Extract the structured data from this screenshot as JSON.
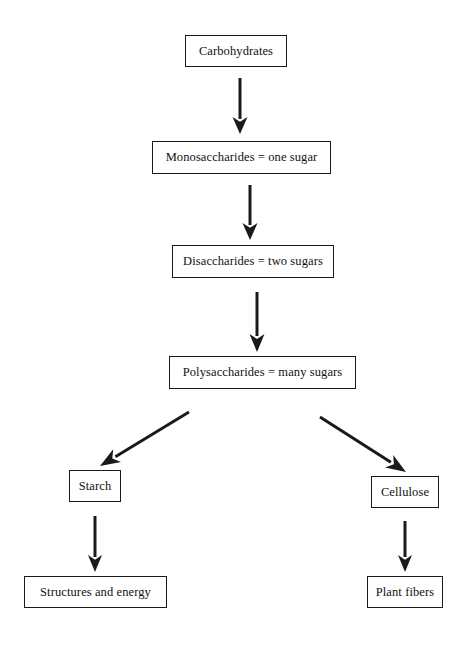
{
  "diagram": {
    "background_color": "#ffffff",
    "line_color": "#1a1a1a",
    "text_color": "#111111",
    "nodes": [
      {
        "id": "carbohydrates",
        "label": "Carbohydrates",
        "x": 185,
        "y": 35,
        "width": 102,
        "height": 32,
        "font_size": 12.5
      },
      {
        "id": "monosaccharides",
        "label": "Monosaccharides = one sugar",
        "x": 152,
        "y": 141,
        "width": 179,
        "height": 33,
        "font_size": 12.5
      },
      {
        "id": "disaccharides",
        "label": "Disaccharides = two sugars",
        "x": 172,
        "y": 245,
        "width": 162,
        "height": 33,
        "font_size": 12.5
      },
      {
        "id": "polysaccharides",
        "label": "Polysaccharides = many sugars",
        "x": 169,
        "y": 356,
        "width": 187,
        "height": 33,
        "font_size": 12.5
      },
      {
        "id": "starch",
        "label": "Starch",
        "x": 69,
        "y": 470,
        "width": 52,
        "height": 32,
        "font_size": 12.5
      },
      {
        "id": "cellulose",
        "label": "Cellulose",
        "x": 371,
        "y": 476,
        "width": 68,
        "height": 32,
        "font_size": 12.5
      },
      {
        "id": "structures-and-energy",
        "label": "Structures and energy",
        "x": 24,
        "y": 576,
        "width": 143,
        "height": 32,
        "font_size": 12.5
      },
      {
        "id": "plant-fibers",
        "label": "Plant fibers",
        "x": 367,
        "y": 576,
        "width": 76,
        "height": 32,
        "font_size": 12.5
      }
    ],
    "edges": [
      {
        "id": "carbohydrates-to-monosaccharides",
        "from": "carbohydrates",
        "to": "monosaccharides",
        "kind": "vertical-arrow",
        "x1": 240,
        "y1": 78,
        "x2": 240,
        "y2": 134,
        "shaft_width": 3,
        "head_width": 15,
        "head_length": 17
      },
      {
        "id": "monosaccharides-to-disaccharides",
        "from": "monosaccharides",
        "to": "disaccharides",
        "kind": "vertical-arrow",
        "x1": 250,
        "y1": 185,
        "x2": 250,
        "y2": 240,
        "shaft_width": 3,
        "head_width": 15,
        "head_length": 17
      },
      {
        "id": "disaccharides-to-polysaccharides",
        "from": "disaccharides",
        "to": "polysaccharides",
        "kind": "vertical-arrow",
        "x1": 257,
        "y1": 292,
        "x2": 257,
        "y2": 352,
        "shaft_width": 3,
        "head_width": 15,
        "head_length": 18
      },
      {
        "id": "polysaccharides-to-starch",
        "from": "polysaccharides",
        "to": "starch",
        "kind": "diagonal-arrow",
        "x1": 189,
        "y1": 412,
        "x2": 100,
        "y2": 466,
        "shaft_width": 3,
        "head_width": 15,
        "head_length": 20
      },
      {
        "id": "polysaccharides-to-cellulose",
        "from": "polysaccharides",
        "to": "cellulose",
        "kind": "diagonal-arrow",
        "x1": 320,
        "y1": 417,
        "x2": 406,
        "y2": 472,
        "shaft_width": 3,
        "head_width": 15,
        "head_length": 20
      },
      {
        "id": "starch-to-structures-and-energy",
        "from": "starch",
        "to": "structures-and-energy",
        "kind": "vertical-arrow",
        "x1": 95,
        "y1": 516,
        "x2": 95,
        "y2": 572,
        "shaft_width": 3,
        "head_width": 14,
        "head_length": 17
      },
      {
        "id": "cellulose-to-plant-fibers",
        "from": "cellulose",
        "to": "plant-fibers",
        "kind": "vertical-arrow",
        "x1": 405,
        "y1": 521,
        "x2": 405,
        "y2": 572,
        "shaft_width": 3,
        "head_width": 14,
        "head_length": 17
      }
    ]
  }
}
